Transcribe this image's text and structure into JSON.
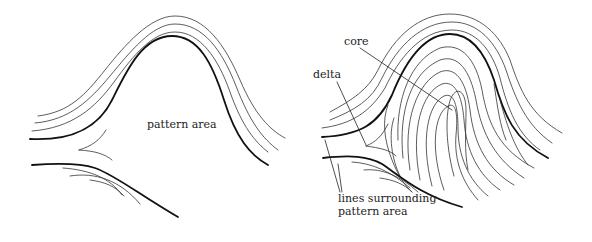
{
  "figure": {
    "left_panel": {
      "title": "Arch pattern (no core/delta)",
      "labels": {
        "pattern_area": "pattern area"
      }
    },
    "right_panel": {
      "labels": {
        "core": "core",
        "delta": "delta",
        "lines_surrounding_line1": "lines surrounding",
        "lines_surrounding_line2": "pattern area"
      }
    },
    "colors": {
      "line": "#1a1a1a",
      "background": "#ffffff",
      "text": "#222222"
    }
  }
}
